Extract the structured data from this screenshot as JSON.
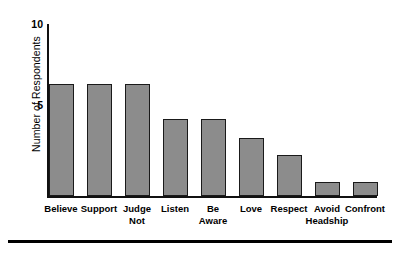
{
  "chart_data": {
    "type": "bar",
    "title": "",
    "xlabel": "",
    "ylabel": "Number of Respondents",
    "ylim": [
      0,
      10
    ],
    "yticks": [
      5,
      10
    ],
    "ytick_labels": [
      "5",
      "10"
    ],
    "grid": false,
    "legend": null,
    "bar_color": "#8c8c8c",
    "bar_edge_color": "#1a1a1a",
    "categories": [
      "Believe",
      "Support",
      "Judge Not",
      "Listen",
      "Be Aware",
      "Love",
      "Respect",
      "Avoid Headship",
      "Confront"
    ],
    "category_lines": [
      [
        "Believe"
      ],
      [
        "Support"
      ],
      [
        "Judge",
        "Not"
      ],
      [
        "Listen"
      ],
      [
        "Be",
        "Aware"
      ],
      [
        "Love"
      ],
      [
        "Respect"
      ],
      [
        "Avoid",
        "Headship"
      ],
      [
        "Confront"
      ]
    ],
    "values": [
      6.5,
      6.5,
      6.5,
      4.5,
      4.5,
      3.4,
      2.4,
      0.8,
      0.8
    ]
  }
}
